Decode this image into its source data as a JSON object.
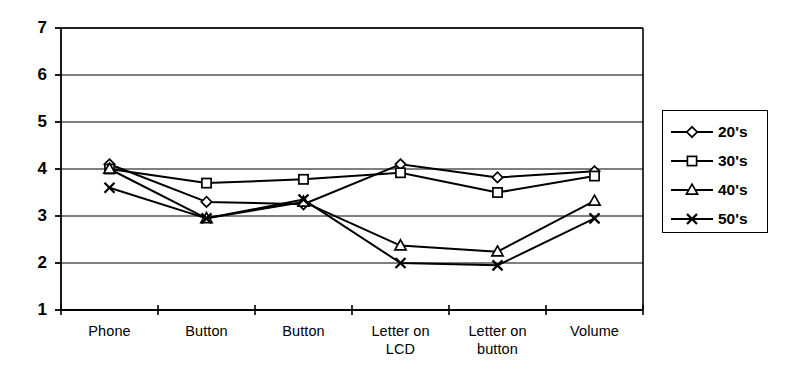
{
  "chart_data": {
    "type": "line",
    "title": "",
    "subtitle": "",
    "xlabel": "",
    "ylabel": "",
    "categories": [
      "Phone",
      "Button",
      "Button",
      "Letter on LCD",
      "Letter on button",
      "Volume"
    ],
    "category_lines": [
      [
        "Phone"
      ],
      [
        "Button"
      ],
      [
        "Button"
      ],
      [
        "Letter on",
        "LCD"
      ],
      [
        "Letter on",
        "button"
      ],
      [
        "Volume"
      ]
    ],
    "ylim": [
      1,
      7
    ],
    "yticks": [
      1,
      2,
      3,
      4,
      5,
      6,
      7
    ],
    "ytick_labels": [
      "1",
      "2",
      "3",
      "4",
      "5",
      "6",
      "7"
    ],
    "grid": "horizontal",
    "legend_position": "right",
    "series": [
      {
        "name": "20's",
        "marker": "diamond",
        "color": "#000000",
        "values": [
          4.1,
          3.3,
          3.25,
          4.1,
          3.82,
          3.95
        ]
      },
      {
        "name": "30's",
        "marker": "square",
        "color": "#000000",
        "values": [
          4.0,
          3.7,
          3.78,
          3.92,
          3.5,
          3.85
        ]
      },
      {
        "name": "40's",
        "marker": "triangle",
        "color": "#000000",
        "values": [
          4.0,
          2.95,
          3.3,
          2.37,
          2.24,
          3.32
        ]
      },
      {
        "name": "50's",
        "marker": "cross",
        "color": "#000000",
        "values": [
          3.6,
          2.95,
          3.35,
          2.0,
          1.95,
          2.95
        ]
      }
    ]
  },
  "legend": {
    "items": [
      {
        "label": "20's",
        "marker": "diamond"
      },
      {
        "label": "30's",
        "marker": "square"
      },
      {
        "label": "40's",
        "marker": "triangle"
      },
      {
        "label": "50's",
        "marker": "cross"
      }
    ]
  },
  "style": {
    "axis_color": "#000000",
    "grid_color": "#000000",
    "plot_background": "#ffffff"
  }
}
